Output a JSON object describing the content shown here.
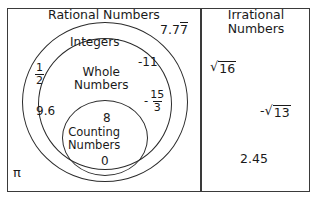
{
  "diagram": {
    "type": "nested-set-venn",
    "title_left": "Rational Numbers",
    "title_right": "Irrational Numbers",
    "title_right_line1": "Irrational",
    "title_right_line2": "Numbers"
  },
  "sets": {
    "rational": {
      "label": "Rational Numbers"
    },
    "integers": {
      "label": "Integers"
    },
    "whole": {
      "label": "Whole Numbers",
      "line1": "Whole",
      "line2": "Numbers"
    },
    "counting": {
      "label": "Counting Numbers",
      "line1": "Counting",
      "line2": "Numbers"
    },
    "irrational": {
      "label": "Irrational Numbers"
    }
  },
  "members": {
    "rational_only": [
      {
        "id": "seven-point-seven-repeating",
        "whole_part": "7.7",
        "repeating_digit": "7",
        "display": "7.7̅"
      },
      {
        "id": "one-half",
        "numerator": "1",
        "denominator": "2",
        "display": "1/2"
      },
      {
        "id": "nine-point-six",
        "display": "9.6"
      }
    ],
    "integers_only": [
      {
        "id": "negative-eleven",
        "display": "-11"
      },
      {
        "id": "negative-fifteen-thirds",
        "sign": "-",
        "numerator": "15",
        "denominator": "3",
        "display": "-15/3"
      }
    ],
    "whole_only": [
      {
        "id": "zero",
        "display": "0"
      }
    ],
    "counting_only": [
      {
        "id": "eight",
        "display": "8"
      }
    ],
    "outside_all": [
      {
        "id": "pi",
        "display": "π"
      }
    ],
    "irrational": [
      {
        "id": "sqrt-16",
        "sign": "",
        "radicand": "16",
        "display": "√16"
      },
      {
        "id": "negative-sqrt-13",
        "sign": "-",
        "radicand": "13",
        "display": "-√13"
      },
      {
        "id": "two-point-four-five",
        "display": "2.45"
      }
    ]
  },
  "glyphs": {
    "radical_sign": "√",
    "minus": "-",
    "pi": "π"
  },
  "colors": {
    "border": "#3a3a3a",
    "ellipse_stroke": "#2b2b2b",
    "text": "#1a1a1a",
    "background": "#ffffff"
  }
}
